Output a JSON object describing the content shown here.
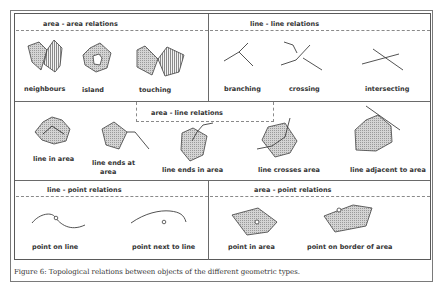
{
  "figure": {
    "caption": "Figure 6: Topological relations between objects of the different geometric types.",
    "sections": {
      "area_area": {
        "title": "area - area relations",
        "items": [
          "neighbours",
          "island",
          "touching"
        ]
      },
      "line_line": {
        "title": "line - line relations",
        "items": [
          "branching",
          "crossing",
          "intersecting"
        ]
      },
      "area_line": {
        "title": "area - line relations",
        "items": [
          "line in area",
          "line ends at",
          "area",
          "line ends in area",
          "line crosses area",
          "line adjacent to area"
        ]
      },
      "line_point": {
        "title": "line - point relations",
        "items": [
          "point on line",
          "point next to line"
        ]
      },
      "area_point": {
        "title": "area - point relations",
        "items": [
          "point in area",
          "point on border of area"
        ]
      }
    },
    "colors": {
      "fill": "#c8c8c8",
      "stroke": "#404040",
      "frame": "#5a5a5a"
    }
  }
}
